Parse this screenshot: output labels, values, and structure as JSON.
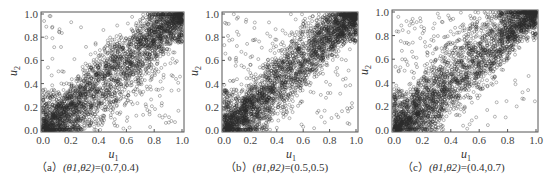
{
  "figure": {
    "panels": [
      {
        "id": "a",
        "caption_prefix": "（a）",
        "caption_params": "(θ1,θ2)",
        "caption_values": "=(0.7,0.4)",
        "xlabel": "u",
        "xlabel_sub": "1",
        "ylabel": "u",
        "ylabel_sub": "2"
      },
      {
        "id": "b",
        "caption_prefix": "（b）",
        "caption_params": "(θ1,θ2)",
        "caption_values": "=(0.5,0.5)",
        "xlabel": "u",
        "xlabel_sub": "1",
        "ylabel": "u",
        "ylabel_sub": "2"
      },
      {
        "id": "c",
        "caption_prefix": "（c）",
        "caption_params": "(θ1,θ2)",
        "caption_values": "=(0.4,0.7)",
        "xlabel": "u",
        "xlabel_sub": "1",
        "ylabel": "u",
        "ylabel_sub": "2"
      }
    ],
    "ticks": [
      "0.0",
      "0.2",
      "0.4",
      "0.6",
      "0.8",
      "1.0"
    ]
  },
  "chart_data": [
    {
      "type": "scatter",
      "title": "(a) (θ1,θ2)=(0.7,0.4)",
      "xlabel": "u1",
      "ylabel": "u2",
      "xlim": [
        0,
        1
      ],
      "ylim": [
        0,
        1
      ],
      "xticks": [
        0.0,
        0.2,
        0.4,
        0.6,
        0.8,
        1.0
      ],
      "yticks": [
        0.0,
        0.2,
        0.4,
        0.6,
        0.8,
        1.0
      ],
      "marker": "hollow circle",
      "n_points_approx": 3000,
      "description": "Dense positive dependence along diagonal; heavy concentration near lower-left (0,0) and upper-right (1,1); points spread more below the diagonal (lower-right) than above; upper-left sparse.",
      "theta": [
        0.7,
        0.4
      ]
    },
    {
      "type": "scatter",
      "title": "(b) (θ1,θ2)=(0.5,0.5)",
      "xlabel": "u1",
      "ylabel": "u2",
      "xlim": [
        0,
        1
      ],
      "ylim": [
        0,
        1
      ],
      "xticks": [
        0.0,
        0.2,
        0.4,
        0.6,
        0.8,
        1.0
      ],
      "yticks": [
        0.0,
        0.2,
        0.4,
        0.6,
        0.8,
        1.0
      ],
      "marker": "hollow circle",
      "n_points_approx": 3000,
      "description": "Symmetric positive dependence concentrated along the diagonal, with tight clusters at both corners (0,0) and (1,1).",
      "theta": [
        0.5,
        0.5
      ]
    },
    {
      "type": "scatter",
      "title": "(c) (θ1,θ2)=(0.4,0.7)",
      "xlabel": "u1",
      "ylabel": "u2",
      "xlim": [
        0,
        1
      ],
      "ylim": [
        0,
        1
      ],
      "xticks": [
        0.0,
        0.2,
        0.4,
        0.6,
        0.8,
        1.0
      ],
      "yticks": [
        0.0,
        0.2,
        0.4,
        0.6,
        0.8,
        1.0
      ],
      "marker": "hollow circle",
      "n_points_approx": 3000,
      "description": "Positive dependence; points spread more above the diagonal (upper-left) than below; lower-right sparse; dense clusters at (0,0) and (1,1).",
      "theta": [
        0.4,
        0.7
      ]
    }
  ]
}
